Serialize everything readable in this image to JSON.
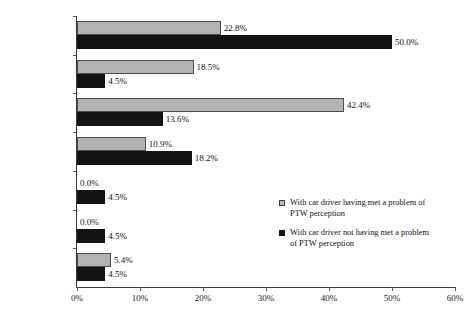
{
  "chart_data": {
    "type": "bar",
    "orientation": "horizontal",
    "title": "",
    "subtitle": "",
    "xlabel": "",
    "ylabel": "",
    "xlim": [
      0,
      60
    ],
    "xtick_labels": [
      "0%",
      "10%",
      "20%",
      "30%",
      "40%",
      "50%",
      "60%"
    ],
    "xticks": [
      0,
      10,
      20,
      30,
      40,
      50,
      60
    ],
    "grid": false,
    "legend_position": "inside-right",
    "categories": [
      "Detection",
      "Diagnosis",
      "Prognosis",
      "Decision",
      "Execution",
      "Overall",
      "No failure"
    ],
    "series": [
      {
        "name": "With car driver having met a problem of PTW perception",
        "legend_label_line1": "With car driver having met a problem of",
        "legend_label_line2": "PTW perception",
        "color": "#b3b3b3",
        "edge_color": "#4d4d4d",
        "values": [
          22.8,
          18.5,
          42.4,
          10.9,
          0.0,
          0.0,
          5.4
        ],
        "value_labels": [
          "22.8%",
          "18.5%",
          "42.4%",
          "10.9%",
          "0.0%",
          "0.0%",
          "5.4%"
        ]
      },
      {
        "name": "With car driver not having met a problem of PTW perception",
        "legend_label_line1": "With car driver not having met a problem",
        "legend_label_line2": "of PTW perception",
        "color": "#141414",
        "edge_color": "#141414",
        "values": [
          50.0,
          4.5,
          13.6,
          18.2,
          4.5,
          4.5,
          4.5
        ],
        "value_labels": [
          "50.0%",
          "4.5%",
          "13.6%",
          "18.2%",
          "4.5%",
          "4.5%",
          "4.5%"
        ]
      }
    ]
  }
}
